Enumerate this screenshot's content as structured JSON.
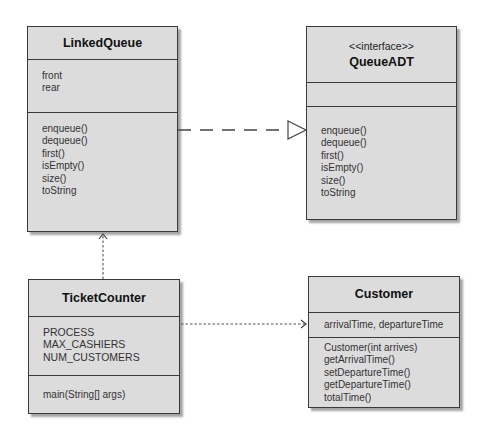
{
  "classes": {
    "linked_queue": {
      "name": "LinkedQueue",
      "attributes": [
        "front",
        "rear"
      ],
      "methods": [
        "enqueue()",
        "dequeue()",
        "first()",
        "isEmpty()",
        "size()",
        "toString"
      ]
    },
    "queue_adt": {
      "stereotype": "<<interface>>",
      "name": "QueueADT",
      "attributes": [],
      "methods": [
        "enqueue()",
        "dequeue()",
        "first()",
        "isEmpty()",
        "size()",
        "toString"
      ]
    },
    "ticket_counter": {
      "name": "TicketCounter",
      "attributes": [
        "PROCESS",
        "MAX_CASHIERS",
        "NUM_CUSTOMERS"
      ],
      "methods": [
        "main(String[] args)"
      ]
    },
    "customer": {
      "name": "Customer",
      "attributes": [
        "arrivalTime, departureTime"
      ],
      "methods": [
        "Customer(int arrives)",
        "getArrivalTime()",
        "setDepartureTime()",
        "getDepartureTime()",
        "totalTime()"
      ]
    }
  },
  "relationships": [
    {
      "from": "LinkedQueue",
      "to": "QueueADT",
      "type": "realization"
    },
    {
      "from": "TicketCounter",
      "to": "LinkedQueue",
      "type": "dependency"
    },
    {
      "from": "TicketCounter",
      "to": "Customer",
      "type": "dependency"
    }
  ],
  "colors": {
    "box_fill": "#dcdcdc",
    "border": "#3a3a3a",
    "line": "#444444"
  }
}
